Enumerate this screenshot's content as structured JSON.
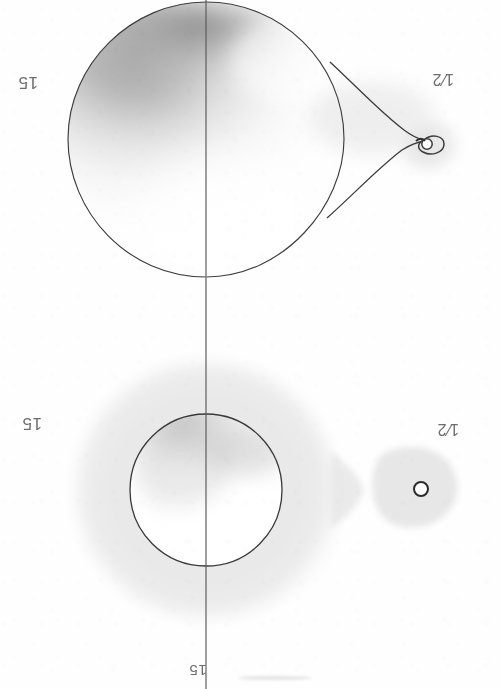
{
  "figure": {
    "kind": "scanned-figure",
    "orientation": "upside-down-scan",
    "background_color": "#fefefe",
    "ink_color": "#3a3a3a",
    "panels": [
      {
        "id": "upper-panel",
        "description": "Teardrop shaped Roche-lobe outline with graded shading in the upper-left quadrant, a narrow neck leading to a cusp and a small circled companion at the right.",
        "labels": {
          "left": "15",
          "right": "1/2"
        }
      },
      {
        "id": "lower-panel",
        "description": "Large soft grey halo surrounding an outlined circle with graded shading, plus a detached grey teardrop containing a small outlined circle at the right.",
        "labels": {
          "left": "15",
          "right": "1/2",
          "axis_bottom": "15"
        }
      }
    ]
  },
  "labels": {
    "upper_left": "15",
    "upper_right_numerator": "1",
    "upper_right_denominator": "2",
    "lower_left": "15",
    "lower_right_numerator": "1",
    "lower_right_denominator": "2",
    "bottom_axis": "15"
  },
  "colors": {
    "line": "#3a3a3a",
    "halo": "#e9e9e9",
    "shade_dark": "#8f8f8f",
    "shade_mid": "#bdbdbd",
    "shade_light": "#ededed",
    "text": "#6d6d6d",
    "paper": "#fefefe"
  },
  "geometry": {
    "canvas_width": 503,
    "canvas_height": 689,
    "axis_x": 206,
    "upper_lobe": {
      "cx": 206,
      "cy": 137,
      "rx": 138,
      "ry": 140,
      "cusp_x": 424,
      "cusp_y": 142
    },
    "upper_companion": {
      "cx": 425,
      "cy": 143,
      "r": 7
    },
    "lower_halo": {
      "cx": 206,
      "cy": 490,
      "rx": 135,
      "ry": 133
    },
    "lower_circle": {
      "cx": 206,
      "cy": 490,
      "r": 76
    },
    "lower_companion_blob": {
      "cx": 419,
      "cy": 490,
      "rx": 42,
      "ry": 36
    },
    "lower_companion_circle": {
      "cx": 420,
      "cy": 489,
      "r": 7
    }
  }
}
